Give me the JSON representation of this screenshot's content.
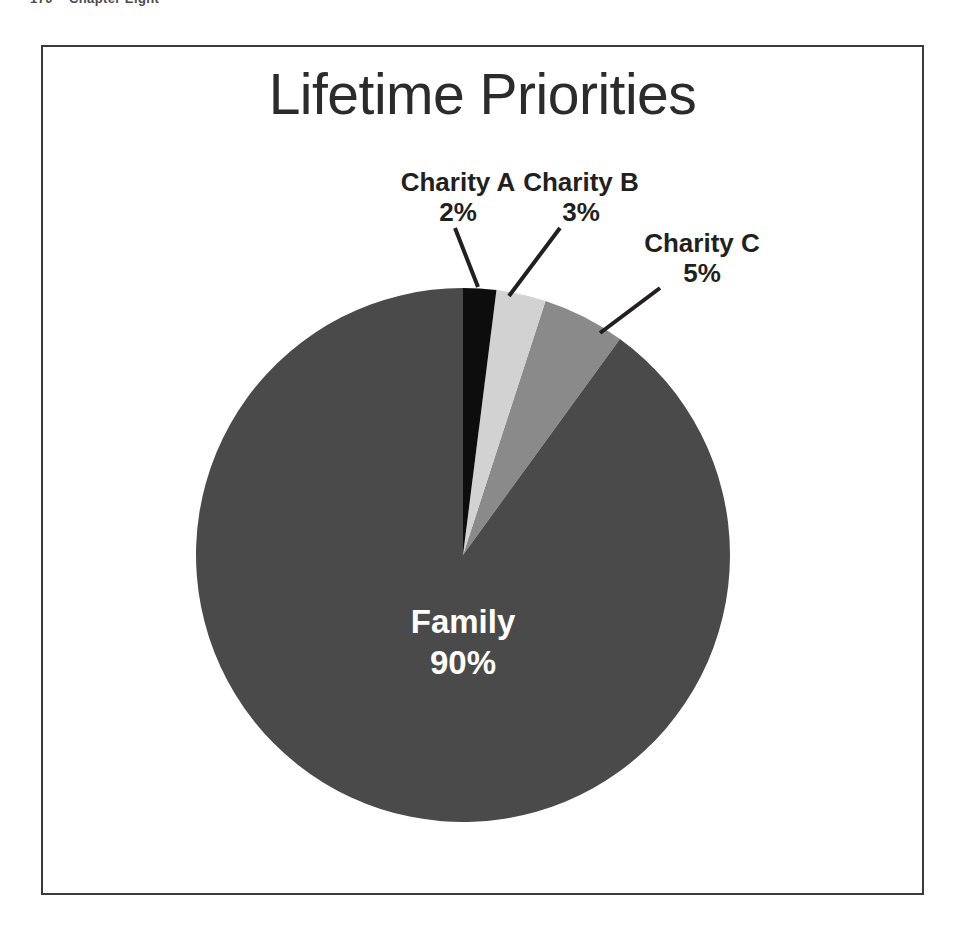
{
  "running_head": {
    "folio": "170",
    "title": "Chapter Eight"
  },
  "figure": {
    "title": "Lifetime Priorities"
  },
  "colors": {
    "family": "#4a4a4a",
    "charity_a": "#0d0d0d",
    "charity_b": "#d2d2d2",
    "charity_c": "#8a8a8a",
    "leader_line": "#231f20",
    "frame": "#3a3a3a",
    "title_text": "#2b2b2b",
    "label_text": "#231f20",
    "inner_label_text": "#ffffff",
    "background": "#ffffff"
  },
  "labels": {
    "charity_a": {
      "name": "Charity A",
      "percent": "2%"
    },
    "charity_b": {
      "name": "Charity B",
      "percent": "3%"
    },
    "charity_c": {
      "name": "Charity C",
      "percent": "5%"
    },
    "family": {
      "name": "Family",
      "percent": "90%"
    }
  },
  "chart_data": {
    "type": "pie",
    "title": "Lifetime Priorities",
    "xlabel": "",
    "ylabel": "",
    "legend": "none",
    "grid": false,
    "start_angle_deg": -90,
    "direction": "clockwise",
    "labels": [
      "Charity A",
      "Charity B",
      "Charity C",
      "Family"
    ],
    "values": [
      2,
      3,
      5,
      90
    ],
    "value_unit": "percent",
    "slices": [
      {
        "label": "Charity A",
        "value": 2,
        "display": "2%",
        "color": "#0d0d0d",
        "label_position": "outside-callout"
      },
      {
        "label": "Charity B",
        "value": 3,
        "display": "3%",
        "color": "#d2d2d2",
        "label_position": "outside-callout"
      },
      {
        "label": "Charity C",
        "value": 5,
        "display": "5%",
        "color": "#8a8a8a",
        "label_position": "outside-callout"
      },
      {
        "label": "Family",
        "value": 90,
        "display": "90%",
        "color": "#4a4a4a",
        "label_position": "inside"
      }
    ],
    "total": 100
  }
}
